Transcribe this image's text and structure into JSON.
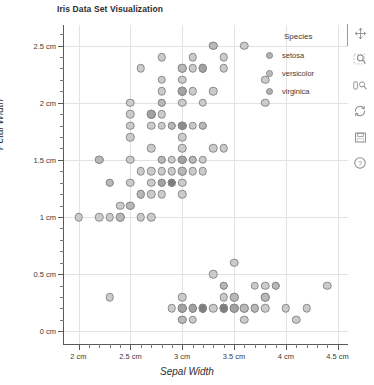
{
  "chart_data": {
    "type": "scatter",
    "title": "Iris Data Set Visualization",
    "xlabel": "Sepal Width",
    "ylabel": "Petal Width",
    "xlim": [
      1.85,
      4.6
    ],
    "ylim": [
      -0.12,
      2.68
    ],
    "grid": true,
    "x_unit": "cm",
    "y_unit": "cm",
    "x_ticks": [
      2,
      2.5,
      3,
      3.5,
      4,
      4.5
    ],
    "y_ticks": [
      0,
      0.5,
      1,
      1.5,
      2,
      2.5
    ],
    "x_tick_labels": [
      "2 cm",
      "2.5 cm",
      "3 cm",
      "3.5 cm",
      "4 cm",
      "4.5 cm"
    ],
    "y_tick_labels": [
      "0 cm",
      "0.5 cm",
      "1 cm",
      "1.5 cm",
      "2 cm",
      "2.5 cm"
    ],
    "x_minor_step": 0.1,
    "y_minor_step": 0.1,
    "legend_position": "upper right",
    "legend_title": "Species",
    "marker_colors": {
      "setosa": "#9a9a9a",
      "versicolor": "#b5b5b5",
      "virginica": "#a5a5a5",
      "overlap_dark": "#7d7d7d",
      "light": "#c6c6c6",
      "edge": "#8a8a8a"
    },
    "series": [
      {
        "name": "setosa",
        "color": "#9a9a9a",
        "points": [
          [
            3.5,
            0.2
          ],
          [
            3.0,
            0.2
          ],
          [
            3.2,
            0.2
          ],
          [
            3.1,
            0.2
          ],
          [
            3.6,
            0.2
          ],
          [
            3.9,
            0.4
          ],
          [
            3.4,
            0.3
          ],
          [
            3.4,
            0.2
          ],
          [
            2.9,
            0.2
          ],
          [
            3.1,
            0.1
          ],
          [
            3.7,
            0.2
          ],
          [
            3.4,
            0.2
          ],
          [
            3.0,
            0.1
          ],
          [
            3.0,
            0.1
          ],
          [
            4.0,
            0.2
          ],
          [
            4.4,
            0.4
          ],
          [
            3.9,
            0.4
          ],
          [
            3.5,
            0.3
          ],
          [
            3.8,
            0.3
          ],
          [
            3.8,
            0.3
          ],
          [
            3.4,
            0.2
          ],
          [
            3.7,
            0.4
          ],
          [
            3.6,
            0.2
          ],
          [
            3.3,
            0.5
          ],
          [
            3.4,
            0.2
          ],
          [
            3.0,
            0.2
          ],
          [
            3.4,
            0.4
          ],
          [
            3.5,
            0.2
          ],
          [
            3.4,
            0.2
          ],
          [
            3.2,
            0.2
          ],
          [
            3.1,
            0.2
          ],
          [
            3.4,
            0.4
          ],
          [
            4.1,
            0.1
          ],
          [
            4.2,
            0.2
          ],
          [
            3.1,
            0.2
          ],
          [
            3.2,
            0.2
          ],
          [
            3.5,
            0.2
          ],
          [
            3.6,
            0.1
          ],
          [
            3.0,
            0.2
          ],
          [
            3.4,
            0.2
          ],
          [
            3.5,
            0.3
          ],
          [
            2.3,
            0.3
          ],
          [
            3.2,
            0.2
          ],
          [
            3.5,
            0.6
          ],
          [
            3.8,
            0.4
          ],
          [
            3.0,
            0.3
          ],
          [
            3.8,
            0.2
          ],
          [
            3.2,
            0.2
          ],
          [
            3.7,
            0.2
          ],
          [
            3.3,
            0.2
          ]
        ]
      },
      {
        "name": "versicolor",
        "color": "#b5b5b5",
        "points": [
          [
            3.2,
            1.4
          ],
          [
            3.2,
            1.5
          ],
          [
            3.1,
            1.5
          ],
          [
            2.3,
            1.3
          ],
          [
            2.8,
            1.5
          ],
          [
            2.8,
            1.3
          ],
          [
            3.3,
            1.6
          ],
          [
            2.4,
            1.0
          ],
          [
            2.9,
            1.3
          ],
          [
            2.7,
            1.4
          ],
          [
            2.0,
            1.0
          ],
          [
            3.0,
            1.5
          ],
          [
            2.2,
            1.0
          ],
          [
            2.9,
            1.4
          ],
          [
            2.9,
            1.3
          ],
          [
            3.1,
            1.4
          ],
          [
            3.0,
            1.5
          ],
          [
            2.7,
            1.0
          ],
          [
            2.2,
            1.5
          ],
          [
            2.5,
            1.1
          ],
          [
            3.2,
            1.8
          ],
          [
            2.8,
            1.3
          ],
          [
            2.5,
            1.5
          ],
          [
            2.8,
            1.2
          ],
          [
            2.9,
            1.3
          ],
          [
            3.0,
            1.4
          ],
          [
            2.8,
            1.4
          ],
          [
            3.0,
            1.7
          ],
          [
            2.9,
            1.5
          ],
          [
            2.6,
            1.0
          ],
          [
            2.4,
            1.1
          ],
          [
            2.4,
            1.0
          ],
          [
            2.7,
            1.2
          ],
          [
            2.7,
            1.6
          ],
          [
            3.0,
            1.5
          ],
          [
            3.4,
            1.6
          ],
          [
            3.1,
            1.5
          ],
          [
            2.3,
            1.3
          ],
          [
            3.0,
            1.3
          ],
          [
            2.5,
            1.3
          ],
          [
            2.6,
            1.2
          ],
          [
            3.0,
            1.4
          ],
          [
            2.6,
            1.2
          ],
          [
            2.3,
            1.0
          ],
          [
            2.7,
            1.3
          ],
          [
            3.0,
            1.2
          ],
          [
            2.9,
            1.3
          ],
          [
            2.9,
            1.3
          ],
          [
            2.5,
            1.1
          ],
          [
            2.8,
            1.3
          ]
        ]
      },
      {
        "name": "virginica",
        "color": "#a5a5a5",
        "points": [
          [
            3.3,
            2.5
          ],
          [
            2.7,
            1.9
          ],
          [
            3.0,
            2.1
          ],
          [
            2.9,
            1.8
          ],
          [
            3.0,
            2.2
          ],
          [
            3.0,
            2.1
          ],
          [
            2.5,
            1.7
          ],
          [
            2.9,
            1.8
          ],
          [
            2.5,
            1.8
          ],
          [
            3.6,
            2.5
          ],
          [
            3.2,
            2.0
          ],
          [
            2.7,
            1.9
          ],
          [
            3.0,
            2.1
          ],
          [
            2.5,
            2.0
          ],
          [
            2.8,
            2.4
          ],
          [
            3.2,
            2.3
          ],
          [
            3.0,
            1.8
          ],
          [
            3.8,
            2.2
          ],
          [
            2.6,
            2.3
          ],
          [
            2.2,
            1.5
          ],
          [
            3.2,
            2.3
          ],
          [
            2.8,
            2.0
          ],
          [
            2.8,
            2.0
          ],
          [
            2.7,
            1.8
          ],
          [
            3.3,
            2.1
          ],
          [
            3.2,
            1.8
          ],
          [
            2.8,
            1.8
          ],
          [
            3.0,
            1.8
          ],
          [
            2.8,
            2.1
          ],
          [
            3.0,
            1.6
          ],
          [
            2.8,
            1.9
          ],
          [
            3.8,
            2.0
          ],
          [
            2.8,
            2.2
          ],
          [
            2.8,
            1.5
          ],
          [
            2.6,
            1.4
          ],
          [
            3.0,
            2.3
          ],
          [
            3.4,
            2.4
          ],
          [
            3.1,
            1.8
          ],
          [
            3.0,
            1.8
          ],
          [
            3.1,
            2.1
          ],
          [
            3.1,
            2.4
          ],
          [
            3.1,
            2.3
          ],
          [
            2.7,
            1.9
          ],
          [
            3.2,
            2.3
          ],
          [
            3.3,
            2.5
          ],
          [
            3.0,
            2.3
          ],
          [
            2.5,
            1.9
          ],
          [
            3.0,
            2.0
          ],
          [
            3.4,
            2.3
          ],
          [
            3.0,
            1.8
          ]
        ]
      }
    ]
  },
  "legend": {
    "title": "Species",
    "items": [
      {
        "label": "setosa",
        "color": "#b1b1b1"
      },
      {
        "label": "versicolor",
        "color": "#bdbdbd"
      },
      {
        "label": "virginica",
        "color": "#b1b1b1"
      }
    ]
  },
  "toolbar": {
    "items": [
      {
        "name": "pan-move-icon",
        "tooltip": "Pan / move"
      },
      {
        "name": "zoom-region-icon",
        "tooltip": "Zoom to region"
      },
      {
        "name": "zoom-axes-icon",
        "tooltip": "Zoom axes"
      },
      {
        "name": "reset-view-icon",
        "tooltip": "Reset view"
      },
      {
        "name": "save-icon",
        "tooltip": "Save image"
      },
      {
        "name": "help-icon",
        "tooltip": "Help"
      }
    ]
  }
}
